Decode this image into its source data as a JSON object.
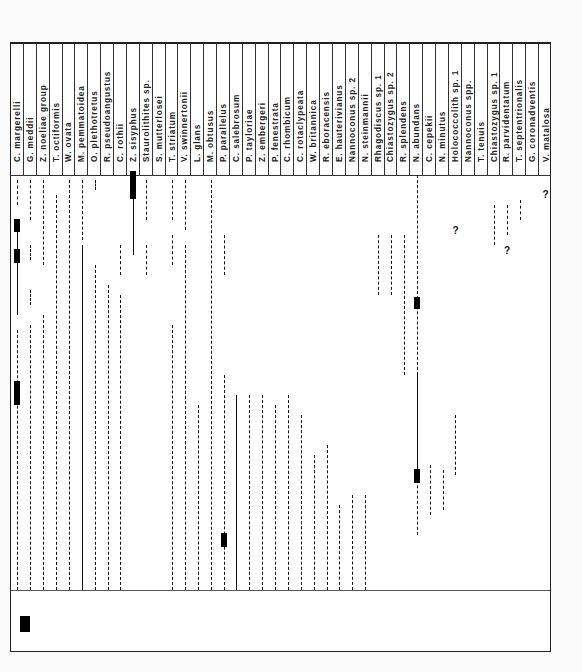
{
  "figure": {
    "type": "range_chart_rotated",
    "species": [
      "C. margerelli",
      "G. meddii",
      "Z. noeliae group",
      "T. octiformis",
      "W. ovata",
      "M. pemmatoidea",
      "O. plethotretus",
      "R. pseudoangustus",
      "C. rothii",
      "Z. sisyphus",
      "Staurolithites sp.",
      "S. mutterlosei",
      "T. striatum",
      "V. swinnertonii",
      "L. glans",
      "M. obtusus",
      "P. parallelus",
      "C. salebrosum",
      "P. tayloriae",
      "Z. embergeri",
      "P. fenestrata",
      "C. rhombicum",
      "C. rotaclypeata",
      "W. britannica",
      "R. eboracensis",
      "E. hauterivianus",
      "Nannoconus sp. 2",
      "N. steinmannii",
      "Rhagodiscus sp. 1",
      "Chiastozygus sp. 2",
      "R. splendens",
      "N. abundans",
      "C. cepekii",
      "N. minutus",
      "Holococcolith sp. 1",
      "Nannoconus spp.",
      "T. tenuis",
      "Chiastozygus sp. 1",
      "R. parvidentatum",
      "T. septentrionalis",
      "G. coronadventis",
      "V. matalosa"
    ],
    "markers": {
      "uncertain": "?"
    }
  }
}
